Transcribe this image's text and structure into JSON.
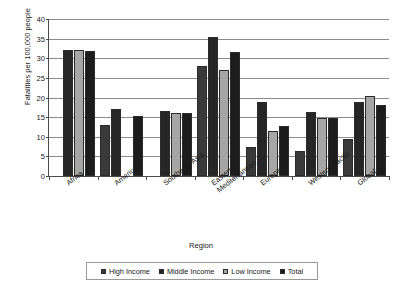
{
  "chart_data": {
    "type": "bar",
    "title": "",
    "xlabel": "Region",
    "ylabel": "Fatalities per 100,000 people",
    "ylim": [
      0,
      40
    ],
    "yticks": [
      0,
      5,
      10,
      15,
      20,
      25,
      30,
      35,
      40
    ],
    "grid": true,
    "legend_position": "bottom",
    "categories": [
      "Africa",
      "Americas",
      "Southeast Asia",
      "Eastern\nMediterranean",
      "Europe",
      "Western Pacific",
      "Global"
    ],
    "series": [
      {
        "name": "High Income",
        "color": "#3a3a3a",
        "values": [
          null,
          13.1,
          null,
          28.0,
          7.4,
          6.4,
          9.5
        ]
      },
      {
        "name": "Middle Income",
        "color": "#262626",
        "values": [
          32.0,
          17.0,
          16.5,
          35.3,
          18.8,
          16.2,
          18.8
        ]
      },
      {
        "name": "Low Income",
        "color": "#a6a6a6",
        "values": [
          32.2,
          null,
          16.1,
          26.9,
          11.5,
          14.9,
          20.5
        ]
      },
      {
        "name": "Total",
        "color": "#1c1c1c",
        "values": [
          31.9,
          15.4,
          16.1,
          31.6,
          12.7,
          14.8,
          18.2
        ]
      }
    ]
  },
  "axis": {
    "y_title": "Fatalities per 100,000 people",
    "x_title": "Region",
    "y_tick_labels": [
      "0",
      "5",
      "10",
      "15",
      "20",
      "25",
      "30",
      "35",
      "40"
    ],
    "x_tick_labels": [
      "Africa",
      "Americas",
      "Southeast Asia",
      "Eastern\nMediterranean",
      "Europe",
      "Western Pacific",
      "Global"
    ]
  },
  "legend": {
    "entries": [
      {
        "label": "High Income",
        "color": "#3a3a3a"
      },
      {
        "label": "Middle Income",
        "color": "#262626"
      },
      {
        "label": "Low Income",
        "color": "#a6a6a6"
      },
      {
        "label": "Total",
        "color": "#1c1c1c"
      }
    ]
  }
}
